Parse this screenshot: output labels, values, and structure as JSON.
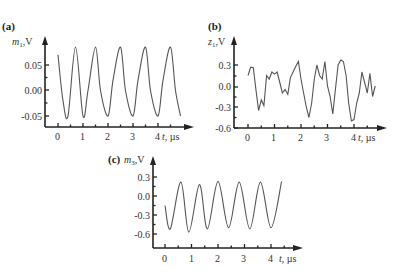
{
  "chart_data": [
    {
      "panel": "(a)",
      "type": "line",
      "ylabel_var": "m",
      "ylabel_sub": "1",
      "ylabel_unit": ",V",
      "xlabel_var": "t",
      "xlabel_unit": ", µs",
      "xticks": [
        "0",
        "1",
        "2",
        "3",
        "4"
      ],
      "yticks": [
        "0.05",
        "0.00",
        "-0.05"
      ],
      "ytick_values": [
        0.05,
        0.0,
        -0.05
      ],
      "xlim": [
        -0.5,
        4.9
      ],
      "ylim": [
        -0.07,
        0.1
      ],
      "description": "Regular sinusoid, ~6 periods over 0–4.9 µs, amplitude ~0.067 V, offset ~0.017 V",
      "x": [
        0.0,
        0.2,
        0.4,
        0.7,
        1.0,
        1.2,
        1.5,
        1.7,
        2.0,
        2.2,
        2.5,
        2.7,
        3.0,
        3.2,
        3.5,
        3.7,
        4.0,
        4.2,
        4.5,
        4.7,
        4.9
      ],
      "y": [
        0.07,
        -0.02,
        -0.05,
        0.085,
        -0.05,
        0.0,
        0.085,
        0.0,
        -0.05,
        0.02,
        0.085,
        0.0,
        -0.05,
        0.02,
        0.085,
        0.0,
        -0.05,
        0.02,
        0.085,
        0.0,
        -0.05
      ]
    },
    {
      "panel": "(b)",
      "type": "line",
      "ylabel_var": "z",
      "ylabel_sub": "1",
      "ylabel_unit": ",V",
      "xlabel_var": "t",
      "xlabel_unit": ", µs",
      "xticks": [
        "0",
        "1",
        "2",
        "3",
        "4"
      ],
      "yticks": [
        "0.3",
        "0.0",
        "-0.3",
        "-0.6"
      ],
      "ytick_values": [
        0.3,
        0.0,
        -0.3,
        -0.6
      ],
      "xlim": [
        -0.5,
        4.9
      ],
      "ylim": [
        -0.6,
        0.55
      ],
      "description": "Irregular noisy signal ranging roughly -0.5 to 0.4 V",
      "x": [
        0.0,
        0.1,
        0.2,
        0.3,
        0.4,
        0.5,
        0.6,
        0.7,
        0.8,
        0.9,
        1.0,
        1.1,
        1.2,
        1.3,
        1.4,
        1.5,
        1.6,
        1.7,
        1.8,
        1.9,
        2.0,
        2.1,
        2.2,
        2.3,
        2.4,
        2.5,
        2.6,
        2.7,
        2.8,
        2.9,
        3.0,
        3.1,
        3.2,
        3.3,
        3.4,
        3.5,
        3.6,
        3.7,
        3.8,
        3.9,
        4.0,
        4.1,
        4.2,
        4.3,
        4.4,
        4.5,
        4.6,
        4.7,
        4.8
      ],
      "y": [
        0.15,
        0.27,
        0.26,
        -0.05,
        -0.35,
        -0.2,
        -0.28,
        0.15,
        0.1,
        0.2,
        0.17,
        0.2,
        0.05,
        -0.1,
        -0.05,
        -0.12,
        0.12,
        0.2,
        0.28,
        0.35,
        0.1,
        -0.1,
        -0.3,
        -0.45,
        -0.25,
        0.1,
        0.3,
        0.15,
        0.1,
        0.35,
        0.0,
        -0.15,
        -0.4,
        -0.05,
        0.3,
        0.37,
        0.35,
        0.15,
        -0.25,
        -0.5,
        -0.48,
        -0.25,
        -0.1,
        0.2,
        0.05,
        -0.1,
        0.18,
        -0.15,
        0.0
      ]
    },
    {
      "panel": "(c)",
      "type": "line",
      "ylabel_var": "m",
      "ylabel_sub": "3",
      "ylabel_unit": ",V",
      "xlabel_var": "t",
      "xlabel_unit": ", µs",
      "xticks": [
        "0",
        "1",
        "2",
        "3",
        "4"
      ],
      "yticks": [
        "0.3",
        "0.0",
        "-0.3",
        "-0.6"
      ],
      "ytick_values": [
        0.3,
        0.0,
        -0.3,
        -0.6
      ],
      "xlim": [
        -0.5,
        4.9
      ],
      "ylim": [
        -0.85,
        0.45
      ],
      "description": "Sinusoid with ~6 periods, peaks ~0.2 V, troughs ~-0.55 V",
      "x": [
        0.0,
        0.2,
        0.6,
        0.9,
        1.3,
        1.6,
        2.0,
        2.4,
        2.8,
        3.2,
        3.6,
        4.0,
        4.4
      ],
      "y": [
        -0.15,
        -0.52,
        0.22,
        -0.57,
        0.18,
        -0.52,
        0.23,
        -0.5,
        0.22,
        -0.52,
        0.22,
        -0.5,
        0.23
      ]
    }
  ]
}
